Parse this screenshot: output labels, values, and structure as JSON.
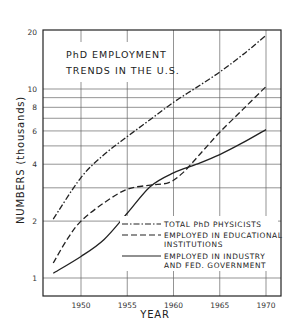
{
  "chart_data": {
    "type": "line",
    "title": "PhD EMPLOYMENT TRENDS IN THE U.S.",
    "title_lines": [
      "PhD EMPLOYMENT",
      "TRENDS IN THE U.S."
    ],
    "xlabel": "YEAR",
    "ylabel": "NUMBERS (thousands)",
    "yscale": "log",
    "ylim": [
      0.9,
      21
    ],
    "xlim": [
      1946,
      1971.5
    ],
    "x_ticks": [
      1950,
      1955,
      1960,
      1965,
      1970
    ],
    "x_tick_labels": [
      "1950",
      "1955",
      "1960",
      "1965",
      "1970"
    ],
    "y_ticks": [
      1,
      2,
      4,
      6,
      8,
      10,
      20
    ],
    "y_tick_labels": [
      "1",
      "2",
      "4",
      "6",
      "8",
      "10",
      "20"
    ],
    "y_gridlines": [
      1,
      2,
      3,
      4,
      5,
      6,
      7,
      8,
      9,
      10,
      20
    ],
    "grid": true,
    "legend_position": "lower right (inside plot)",
    "series": [
      {
        "name": "TOTAL PhD PHYSICISTS",
        "style": "dash-dot",
        "x": [
          1947,
          1950,
          1952.5,
          1955,
          1957.5,
          1960,
          1962.5,
          1965,
          1967.5,
          1970
        ],
        "values": [
          2.05,
          3.4,
          4.5,
          5.6,
          6.9,
          8.5,
          10.2,
          12.3,
          15.2,
          19.2
        ]
      },
      {
        "name": "EMPLOYED IN EDUCATIONAL INSTITUTIONS",
        "style": "dashed",
        "x": [
          1947,
          1948.5,
          1950,
          1952.5,
          1955,
          1957.5,
          1959.5,
          1961,
          1963,
          1965,
          1967.5,
          1970
        ],
        "values": [
          1.2,
          1.6,
          2.0,
          2.5,
          2.95,
          3.1,
          3.2,
          3.6,
          4.6,
          5.9,
          7.8,
          10.3
        ]
      },
      {
        "name": "EMPLOYED IN INDUSTRY AND FED. GOVERNMENT",
        "style": "solid",
        "x": [
          1947,
          1950,
          1952.5,
          1955,
          1957.5,
          1960,
          1962.5,
          1965,
          1967.5,
          1970
        ],
        "values": [
          1.06,
          1.3,
          1.6,
          2.2,
          3.05,
          3.6,
          4.0,
          4.5,
          5.2,
          6.1
        ]
      }
    ]
  },
  "legend": {
    "items": [
      {
        "lines": [
          "TOTAL PhD PHYSICISTS"
        ]
      },
      {
        "lines": [
          "EMPLOYED IN EDUCATIONAL",
          "INSTITUTIONS"
        ]
      },
      {
        "lines": [
          "EMPLOYED IN INDUSTRY",
          "AND FED. GOVERNMENT"
        ]
      }
    ]
  },
  "colors": {
    "ink": "#222222",
    "grid": "#555555",
    "background": "#ffffff"
  }
}
